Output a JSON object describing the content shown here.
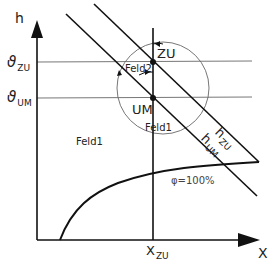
{
  "diagram": {
    "type": "h-x chart (Mollier) mixing diagram",
    "axes": {
      "y_label": "h",
      "x_label": "X"
    },
    "temperature_labels": {
      "zu": {
        "symbol": "ϑ",
        "sub": "ZU"
      },
      "um": {
        "symbol": "ϑ",
        "sub": "UM"
      }
    },
    "x_tick": {
      "main": "X",
      "sub": "ZU"
    },
    "points": {
      "zu": "ZU",
      "um": "UM"
    },
    "regions": {
      "feld1_left": "Feld1",
      "feld1_circle": "Feld1",
      "feld2": "Feld2"
    },
    "lines": {
      "h_zu": {
        "main": "h",
        "sub": "ZU"
      },
      "h_um": {
        "main": "h",
        "sub": "UM"
      }
    },
    "saturation_curve": "φ=100%",
    "colors": {
      "line": "#111111",
      "thin_line": "#777777",
      "background": "#ffffff"
    }
  }
}
